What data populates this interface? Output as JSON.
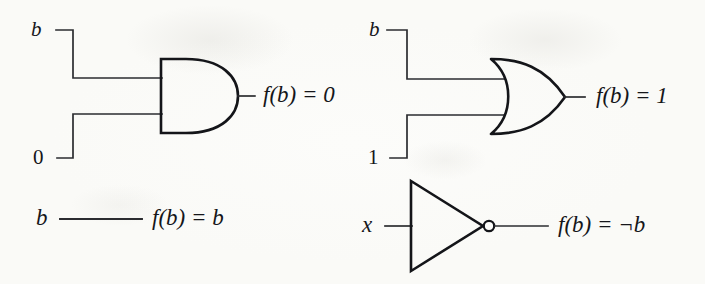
{
  "figure": {
    "background_color": "#fdfdfb",
    "ink_color": "#15161a"
  },
  "diagrams": [
    {
      "id": "and-gate-zero",
      "gate_type": "AND",
      "position": "top-left",
      "inputs": [
        {
          "name": "input-b",
          "label": "b",
          "italic": true
        },
        {
          "name": "input-0",
          "label": "0",
          "italic": false
        }
      ],
      "output": {
        "name": "output-f-equals-0",
        "label": "f(b) = 0"
      }
    },
    {
      "id": "or-gate-one",
      "gate_type": "OR",
      "position": "top-right",
      "inputs": [
        {
          "name": "input-b",
          "label": "b",
          "italic": true
        },
        {
          "name": "input-1",
          "label": "1",
          "italic": false
        }
      ],
      "output": {
        "name": "output-f-equals-1",
        "label": "f(b) = 1"
      }
    },
    {
      "id": "identity-wire",
      "gate_type": "WIRE",
      "position": "bottom-left",
      "inputs": [
        {
          "name": "input-b",
          "label": "b",
          "italic": true
        }
      ],
      "output": {
        "name": "output-f-equals-b",
        "label": "f(b) = b"
      }
    },
    {
      "id": "not-gate-negation",
      "gate_type": "NOT",
      "position": "bottom-right",
      "inputs": [
        {
          "name": "input-x",
          "label": "x",
          "italic": true
        }
      ],
      "output": {
        "name": "output-f-equals-not-b",
        "label": "f(b) = ¬b"
      }
    }
  ],
  "labels": {
    "and_input_b": "b",
    "and_input_0": "0",
    "and_output": "f(b) = 0",
    "or_input_b": "b",
    "or_input_1": "1",
    "or_output": "f(b) = 1",
    "wire_input_b": "b",
    "wire_output": "f(b) = b",
    "not_input_x": "x",
    "not_output": "f(b) = ¬b"
  }
}
